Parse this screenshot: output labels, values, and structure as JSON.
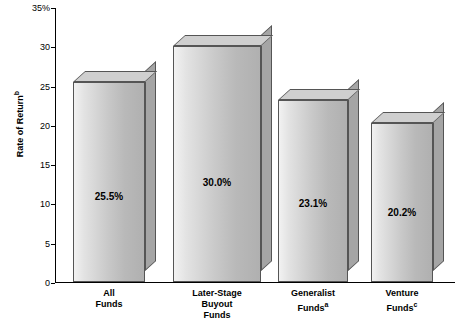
{
  "chart_data": {
    "type": "bar",
    "title": "",
    "xlabel": "",
    "ylabel": "Rate of Return",
    "ylabel_superscript": "b",
    "ylim": [
      0,
      35
    ],
    "yticks": [
      "0",
      "5",
      "10",
      "15",
      "20",
      "25",
      "30",
      "35%"
    ],
    "grid": false,
    "legend": "none",
    "categories": [
      {
        "line1": "All",
        "line2": "Funds",
        "line3": "",
        "sup": ""
      },
      {
        "line1": "Later-Stage",
        "line2": "Buyout",
        "line3": "Funds",
        "sup": ""
      },
      {
        "line1": "Generalist",
        "line2": "Funds",
        "line3": "",
        "sup": "a"
      },
      {
        "line1": "Venture",
        "line2": "Funds",
        "line3": "",
        "sup": "c"
      }
    ],
    "values": [
      25.5,
      30.0,
      23.1,
      20.2
    ],
    "value_labels": [
      "25.5%",
      "30.0%",
      "23.1%",
      "20.2%"
    ]
  },
  "style": {
    "bar_face_light": "#f2f2f2",
    "bar_face_dark": "#b0b0b0",
    "bar_top": "#cfcfcf",
    "bar_side": "#a5a5a5",
    "outline": "#555555",
    "axis_color": "#000000",
    "background": "#ffffff"
  }
}
